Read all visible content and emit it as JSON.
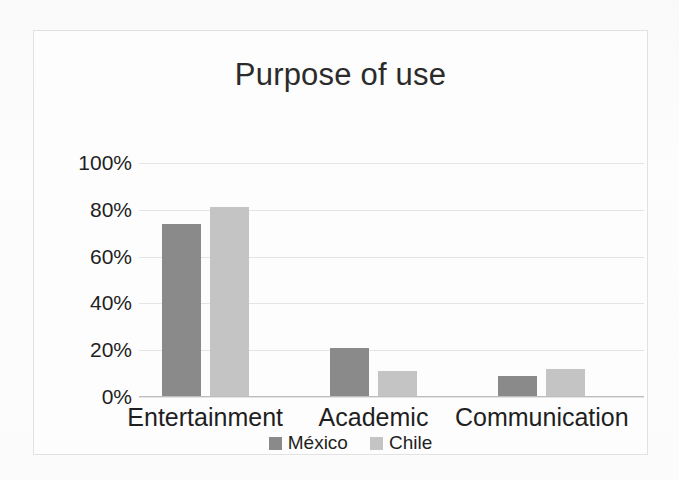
{
  "chart_data": {
    "type": "bar",
    "title": "Purpose of use",
    "xlabel": "",
    "ylabel": "",
    "categories": [
      "Entertainment",
      "Academic",
      "Communication"
    ],
    "series": [
      {
        "name": "México",
        "color": "#8a8a8a",
        "values": [
          74,
          21,
          9
        ]
      },
      {
        "name": "Chile",
        "color": "#c4c4c4",
        "values": [
          81,
          11,
          12
        ]
      }
    ],
    "ylim": [
      0,
      100
    ],
    "y_ticks": [
      0,
      20,
      40,
      60,
      80,
      100
    ],
    "y_tick_labels": [
      "0%",
      "20%",
      "40%",
      "60%",
      "80%",
      "100%"
    ],
    "value_suffix": "%",
    "grid": true,
    "legend_position": "bottom"
  },
  "frame": {
    "border_color": "#e2e2e2",
    "background": "#fdfdfd"
  }
}
